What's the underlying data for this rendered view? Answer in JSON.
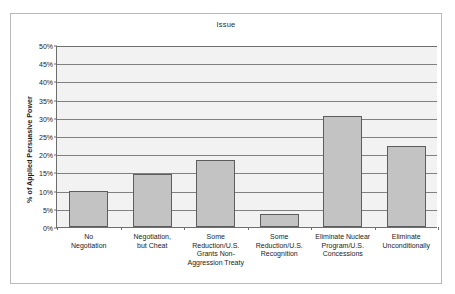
{
  "chart_data": {
    "type": "bar",
    "title": "Issue",
    "xlabel": "",
    "ylabel": "% of Applied Persuasive Power",
    "ylim": [
      0,
      50
    ],
    "ytick_step": 5,
    "grid": true,
    "legend": "none",
    "categories": [
      "No Negotiation",
      "Negotiation, but Cheat",
      "Some Reduction/U.S. Grants Non-Aggression Treaty",
      "Some Reduction/U.S. Recognition",
      "Eliminate Nuclear Program/U.S. Concessions",
      "Eliminate Unconditionally"
    ],
    "values": [
      10,
      14.5,
      18.3,
      3.7,
      30.5,
      22.2
    ],
    "ytick_labels": [
      "50%",
      "45%",
      "40%",
      "35%",
      "30%",
      "25%",
      "20%",
      "15%",
      "10%",
      "5%",
      "0%"
    ],
    "ytick_values": [
      50,
      45,
      40,
      35,
      30,
      25,
      20,
      15,
      10,
      5,
      0
    ],
    "category_lines": [
      [
        "No",
        "Negotiation"
      ],
      [
        "Negotiation,",
        "but Cheat"
      ],
      [
        "Some",
        "Reduction/U.S.",
        "Grants Non-",
        "Aggression Treaty"
      ],
      [
        "Some",
        "Reduction/U.S.",
        "Recognition"
      ],
      [
        "Eliminate Nuclear",
        "Program/U.S.",
        "Concessions"
      ],
      [
        "Eliminate",
        "Unconditionally"
      ]
    ],
    "colors": {
      "bar_fill": "#c3c3c3",
      "bar_border": "#5d5d5d",
      "plot_background": "#f2f2f2",
      "gridline": "#808080",
      "axis": "#6e6e6e",
      "frame": "#b9b9b9",
      "text": "#222222"
    }
  }
}
